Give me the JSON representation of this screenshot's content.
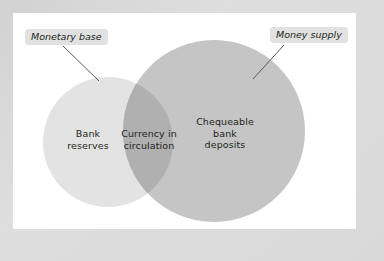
{
  "figure": {
    "title_visible": false,
    "frame_color": "#d9d9d9",
    "panel_color": "#ffffff"
  },
  "diagram": {
    "type": "venn",
    "sets": [
      {
        "id": "monetary-base",
        "callout_label": "Monetary base",
        "region_label": "Bank\nreserves",
        "fill": "#e3e3e3",
        "cx": 108,
        "cy": 142,
        "r": 65
      },
      {
        "id": "money-supply",
        "callout_label": "Money supply",
        "region_label": "Chequeable\nbank\ndeposits",
        "fill": "#c5c5c5",
        "cx": 214,
        "cy": 131,
        "r": 91
      }
    ],
    "intersection": {
      "id": "currency-in-circulation",
      "label": "Currency in\ncirculation",
      "fill": "#b0b0b0"
    },
    "leader_lines": [
      {
        "id": "leader-monetary-base",
        "from": [
          63,
          45
        ],
        "to": [
          98,
          80
        ],
        "color": "#555555"
      },
      {
        "id": "leader-money-supply",
        "from": [
          283,
          44
        ],
        "to": [
          254,
          78
        ],
        "color": "#555555"
      }
    ]
  },
  "labels": {
    "bank_reserves": "Bank\nreserves",
    "currency_in_circulation": "Currency in\ncirculation",
    "chequeable_bank_deposits": "Chequeable\nbank\ndeposits",
    "monetary_base": "Monetary base",
    "money_supply": "Money supply"
  }
}
